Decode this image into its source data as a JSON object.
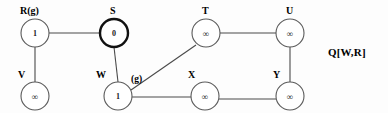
{
  "figure": {
    "type": "graph-diagram",
    "background_color": "#fdfdfd",
    "edge_color": "#4a4a4a",
    "node_fill": "#ffffff",
    "node_stroke": "#5a5a5a",
    "highlight_stroke": "#111111"
  },
  "nodes": [
    {
      "id": "R",
      "label": "R(g)",
      "value": "1",
      "cx": 35,
      "cy": 33,
      "r": 14,
      "highlighted": false,
      "label_x": 20,
      "label_y": 6
    },
    {
      "id": "S",
      "label": "S",
      "value": "0",
      "cx": 114,
      "cy": 33,
      "r": 14,
      "highlighted": true,
      "label_x": 110,
      "label_y": 6
    },
    {
      "id": "T",
      "label": "T",
      "value": "∞",
      "cx": 206,
      "cy": 33,
      "r": 14,
      "highlighted": false,
      "label_x": 202,
      "label_y": 6
    },
    {
      "id": "U",
      "label": "U",
      "value": "∞",
      "cx": 290,
      "cy": 33,
      "r": 14,
      "highlighted": false,
      "label_x": 286,
      "label_y": 6
    },
    {
      "id": "V",
      "label": "V",
      "value": "∞",
      "cx": 35,
      "cy": 96,
      "r": 14,
      "highlighted": false,
      "label_x": 18,
      "label_y": 70
    },
    {
      "id": "W",
      "label": "W",
      "value": "1",
      "cx": 118,
      "cy": 96,
      "r": 14,
      "highlighted": false,
      "label_x": 96,
      "label_y": 70
    },
    {
      "id": "X",
      "label": "X",
      "value": "∞",
      "cx": 205,
      "cy": 96,
      "r": 14,
      "highlighted": false,
      "label_x": 188,
      "label_y": 70
    },
    {
      "id": "Y",
      "label": "Y",
      "value": "∞",
      "cx": 290,
      "cy": 96,
      "r": 14,
      "highlighted": false,
      "label_x": 273,
      "label_y": 70
    }
  ],
  "edges": [
    {
      "from": "R",
      "to": "S",
      "x1": 49,
      "y1": 33,
      "x2": 100,
      "y2": 33
    },
    {
      "from": "R",
      "to": "V",
      "x1": 35,
      "y1": 47,
      "x2": 35,
      "y2": 82
    },
    {
      "from": "S",
      "to": "W",
      "x1": 114,
      "y1": 47,
      "x2": 118,
      "y2": 82
    },
    {
      "from": "W",
      "to": "T",
      "x1": 131,
      "y1": 90,
      "x2": 196,
      "y2": 45
    },
    {
      "from": "W",
      "to": "X",
      "x1": 132,
      "y1": 97,
      "x2": 191,
      "y2": 97
    },
    {
      "from": "T",
      "to": "U",
      "x1": 220,
      "y1": 33,
      "x2": 276,
      "y2": 33
    },
    {
      "from": "U",
      "to": "Y",
      "x1": 290,
      "y1": 47,
      "x2": 290,
      "y2": 82
    },
    {
      "from": "X",
      "to": "Y",
      "x1": 219,
      "y1": 99,
      "x2": 276,
      "y2": 99
    }
  ],
  "edge_labels": [
    {
      "text": "(g)",
      "x": 131,
      "y": 75
    }
  ],
  "annotations": {
    "queue": {
      "text": "Q[W,R]",
      "x": 328,
      "y": 46
    }
  }
}
